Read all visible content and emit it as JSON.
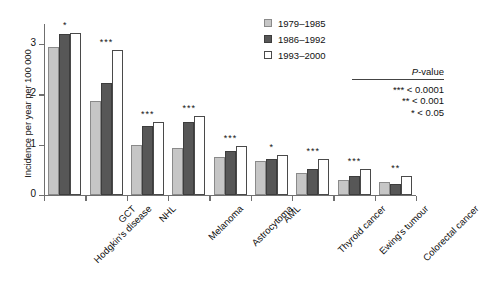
{
  "chart_data": {
    "type": "bar",
    "title": "",
    "xlabel": "",
    "ylabel": "Incidence per year per 100 000",
    "ylim": [
      0,
      3.4
    ],
    "yticks": [
      0,
      1,
      2,
      3
    ],
    "ytick_labels": [
      "0",
      "1",
      "2",
      "3"
    ],
    "grid": false,
    "legend_position": "top-right",
    "categories": [
      "Hodgkin's disease",
      "GCT",
      "NHL",
      "Melanoma",
      "Astrocytoma",
      "AML",
      "Thyroid cancer",
      "Ewing's tumour",
      "Colorectal cancer"
    ],
    "series": [
      {
        "name": "1979–1985",
        "color": "#c6c6c6",
        "values": [
          2.95,
          1.86,
          1.0,
          0.94,
          0.75,
          0.68,
          0.44,
          0.3,
          0.25
        ]
      },
      {
        "name": "1986–1992",
        "color": "#575757",
        "values": [
          3.2,
          2.22,
          1.38,
          1.46,
          0.88,
          0.72,
          0.52,
          0.38,
          0.22
        ]
      },
      {
        "name": "1993–2000",
        "color": "#ffffff",
        "values": [
          3.22,
          2.88,
          1.46,
          1.57,
          0.98,
          0.79,
          0.72,
          0.52,
          0.38
        ]
      }
    ],
    "significance": [
      "*",
      "***",
      "***",
      "***",
      "***",
      "*",
      "***",
      "***",
      "**"
    ]
  },
  "legend": {
    "items": [
      {
        "label": "1979–1985",
        "swatch": "light-gray"
      },
      {
        "label": "1986–1992",
        "swatch": "dark-gray"
      },
      {
        "label": "1993–2000",
        "swatch": "white"
      }
    ]
  },
  "pvalue_key": {
    "title_italic": "P",
    "title_rest": "-value",
    "rows": [
      "*** < 0.0001",
      "** < 0.001",
      "* < 0.05"
    ]
  }
}
